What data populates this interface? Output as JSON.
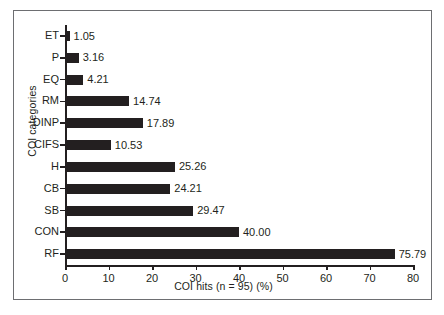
{
  "chart_data": {
    "type": "bar",
    "orientation": "horizontal",
    "title": "",
    "xlabel": "COI hits (n = 95) (%)",
    "ylabel": "COI categories",
    "xlim": [
      0,
      80
    ],
    "xticks": [
      0,
      10,
      20,
      30,
      40,
      50,
      60,
      70,
      80
    ],
    "grid": false,
    "legend": null,
    "bar_color": "#231f20",
    "categories": [
      "ET",
      "P",
      "EQ",
      "RM",
      "DINP",
      "CIFS",
      "H",
      "CB",
      "SB",
      "CON",
      "RF"
    ],
    "values": [
      1.05,
      3.16,
      4.21,
      14.74,
      17.89,
      10.53,
      25.26,
      24.21,
      29.47,
      40.0,
      75.79
    ],
    "value_labels": [
      "1.05",
      "3.16",
      "4.21",
      "14.74",
      "17.89",
      "10.53",
      "25.26",
      "24.21",
      "29.47",
      "40.00",
      "75.79"
    ]
  },
  "caption": {
    "text": " "
  }
}
